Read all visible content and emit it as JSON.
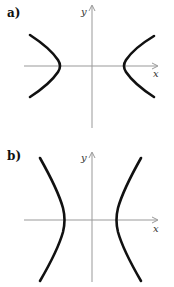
{
  "figure": {
    "type": "hyperbola-graphs",
    "panels": [
      {
        "label": "a)",
        "x_axis_label": "x",
        "y_axis_label": "y",
        "orientation": "horizontal-opening",
        "description": "Hyperbola opening left and right; vertices on x-axis"
      },
      {
        "label": "b)",
        "x_axis_label": "x",
        "y_axis_label": "y",
        "orientation": "horizontal-opening-steep",
        "description": "Hyperbola opening left and right with steep branches; vertices on x-axis"
      }
    ],
    "colors": {
      "axis": "#999999",
      "curve": "#111111",
      "background": "#ffffff"
    }
  }
}
